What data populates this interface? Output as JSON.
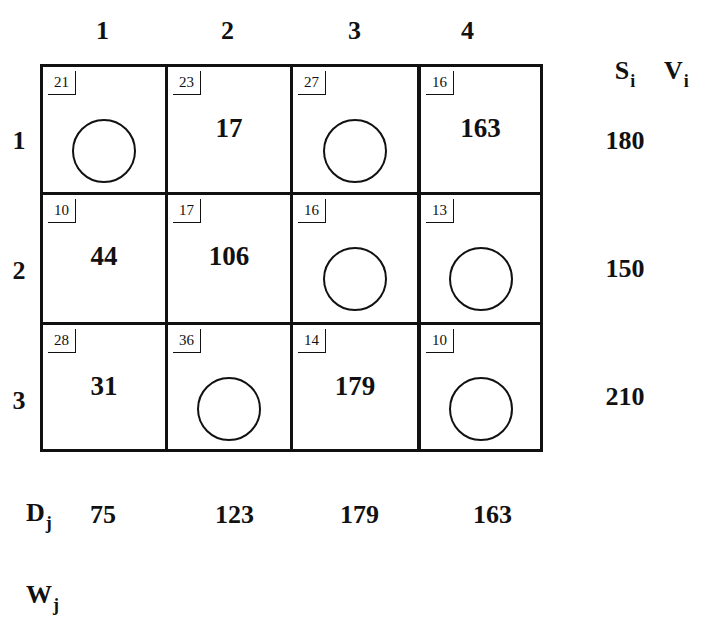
{
  "columns": [
    "1",
    "2",
    "3",
    "4"
  ],
  "rows": [
    "1",
    "2",
    "3"
  ],
  "headers": {
    "supply": {
      "base": "S",
      "sub": "i"
    },
    "v": {
      "base": "V",
      "sub": "i"
    },
    "demand": {
      "base": "D",
      "sub": "j"
    },
    "w": {
      "base": "W",
      "sub": "j"
    }
  },
  "cells": [
    [
      {
        "cost": "21",
        "alloc": null
      },
      {
        "cost": "23",
        "alloc": "17"
      },
      {
        "cost": "27",
        "alloc": null
      },
      {
        "cost": "16",
        "alloc": "163"
      }
    ],
    [
      {
        "cost": "10",
        "alloc": "44"
      },
      {
        "cost": "17",
        "alloc": "106"
      },
      {
        "cost": "16",
        "alloc": null
      },
      {
        "cost": "13",
        "alloc": null
      }
    ],
    [
      {
        "cost": "28",
        "alloc": "31"
      },
      {
        "cost": "36",
        "alloc": null
      },
      {
        "cost": "14",
        "alloc": "179"
      },
      {
        "cost": "10",
        "alloc": null
      }
    ]
  ],
  "supply": [
    "180",
    "150",
    "210"
  ],
  "demand": [
    "75",
    "123",
    "179",
    "163"
  ],
  "colors": {
    "ink": "#111111",
    "background": "#ffffff"
  }
}
